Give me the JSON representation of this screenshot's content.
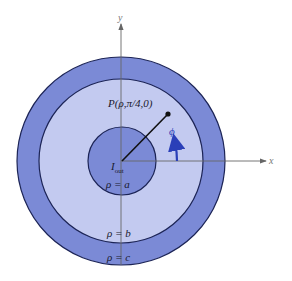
{
  "diagram": {
    "colors": {
      "outer_conductor": "#7b8ad6",
      "dielectric": "#c3caf0",
      "inner_conductor": "#7b8ad6",
      "outline": "#1c2456",
      "axis": "#666666",
      "phi_arrow": "#2a3fb8",
      "radius_line": "#111111"
    },
    "geometry": {
      "center": [
        121,
        161
      ],
      "radius_c": 104,
      "radius_b": 82,
      "radius_a": 34,
      "point_P": [
        168,
        114
      ]
    },
    "axes": {
      "x_label": "x",
      "y_label": "y"
    },
    "labels": {
      "point": "P(ρ,π/4,0)",
      "phi": "ϕ",
      "current_main": "I",
      "current_sub": "out",
      "rho_a": "ρ = a",
      "rho_b": "ρ = b",
      "rho_c": "ρ = c"
    }
  }
}
